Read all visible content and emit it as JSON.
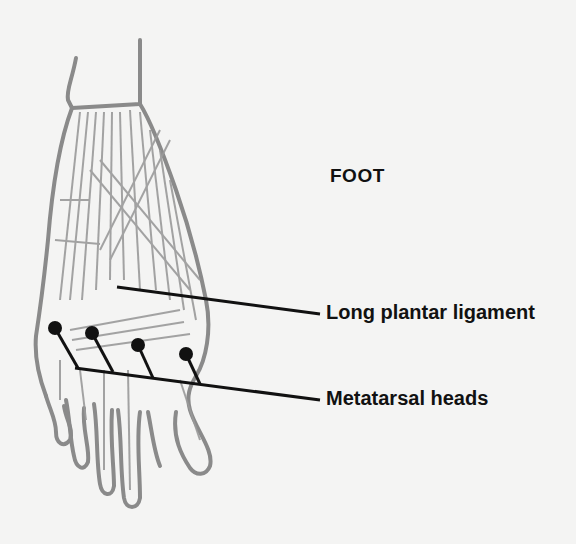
{
  "figure": {
    "title": "FOOT",
    "background_color": "#f4f4f3",
    "illustration_color": "#8a8a8a",
    "leader_color": "#111111"
  },
  "labels": [
    {
      "id": "long-plantar-ligament",
      "text": "Long plantar ligament"
    },
    {
      "id": "metatarsal-heads",
      "text": "Metatarsal heads"
    }
  ],
  "markers": {
    "metatarsal_heads_count": 4
  }
}
